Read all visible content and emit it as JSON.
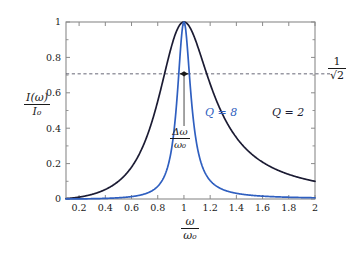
{
  "figure": {
    "background_color": "#ffffff",
    "frame_color": "#8a8a8a",
    "axis_label_color": "#1a1a1a"
  },
  "chart_data": {
    "type": "line",
    "title": "",
    "subtitle": "",
    "xlabel": "ω/ω₀",
    "ylabel": "I(ω)/I₀",
    "xlim": [
      0.1,
      2
    ],
    "ylim": [
      0,
      1
    ],
    "grid": false,
    "legend_position": "inline-on-curves",
    "x_ticks": [
      0.2,
      0.4,
      0.6,
      0.8,
      1,
      1.2,
      1.4,
      1.6,
      1.8,
      2
    ],
    "x_tick_labels": [
      "0.2",
      "0.4",
      "0.6",
      "0.8",
      "1",
      "1.2",
      "1.4",
      "1.6",
      "1.8",
      "2"
    ],
    "y_ticks": [
      0,
      0.2,
      0.4,
      0.6,
      0.8,
      1
    ],
    "y_tick_labels": [
      "0",
      "0.2",
      "0.4",
      "0.6",
      "0.8",
      "1"
    ],
    "y_minor_ticks": [
      0.1,
      0.3,
      0.5,
      0.7,
      0.9
    ],
    "series": [
      {
        "name": "Q = 2",
        "label": "Q = 2",
        "color": "#1b1b33",
        "Q": 2,
        "model": "lorentzian_resonance_intensity",
        "formula": "1 / (1 + Q^2 * (x - 1/x)^2)",
        "x": [
          0.1,
          0.2,
          0.3,
          0.4,
          0.5,
          0.6,
          0.7,
          0.8,
          0.9,
          0.95,
          1.0,
          1.05,
          1.1,
          1.2,
          1.3,
          1.4,
          1.5,
          1.6,
          1.7,
          1.8,
          1.9,
          2.0
        ],
        "values": [
          0.0063,
          0.0257,
          0.0609,
          0.1154,
          0.2,
          0.331,
          0.5168,
          0.7326,
          0.9264,
          0.9802,
          1.0,
          0.9823,
          0.9337,
          0.7974,
          0.6535,
          0.5297,
          0.4308,
          0.354,
          0.2945,
          0.248,
          0.2113,
          0.1818
        ],
        "half_max_crossings": [
          0.78,
          1.28
        ]
      },
      {
        "name": "Q = 8",
        "label": "Q = 8",
        "color": "#2f5fc0",
        "Q": 8,
        "model": "lorentzian_resonance_intensity",
        "formula": "1 / (1 + Q^2 * (x - 1/x)^2)",
        "x": [
          0.1,
          0.2,
          0.3,
          0.4,
          0.5,
          0.6,
          0.7,
          0.8,
          0.9,
          0.95,
          0.98,
          1.0,
          1.02,
          1.05,
          1.1,
          1.2,
          1.3,
          1.4,
          1.5,
          1.6,
          1.7,
          1.8,
          1.9,
          2.0
        ],
        "values": [
          0.0004,
          0.0016,
          0.0039,
          0.0075,
          0.0139,
          0.0254,
          0.0476,
          0.0927,
          0.1885,
          0.3325,
          0.5896,
          1.0,
          0.6062,
          0.3545,
          0.1615,
          0.0664,
          0.0353,
          0.0215,
          0.0143,
          0.0101,
          0.0075,
          0.0058,
          0.0046,
          0.0037
        ],
        "half_max_crossings": [
          0.9695,
          1.032
        ]
      }
    ],
    "reference_lines": [
      {
        "name": "half-power-line",
        "orientation": "horizontal",
        "value": 0.7071,
        "label": "1/√2",
        "style": "dashed",
        "color": "#555566"
      }
    ],
    "annotations": [
      {
        "name": "fwhm-annotation",
        "label": "Δω/ω₀",
        "numerator": "Δω",
        "denominator": "ω₀",
        "type": "double-headed-arrow-with-leader",
        "at_y": 0.7071,
        "x_start": 0.9695,
        "x_end": 1.032,
        "color": "#1a1a1a"
      }
    ]
  },
  "labels": {
    "y_axis": {
      "numerator": "I(ω)",
      "denominator": "I₀"
    },
    "x_axis": {
      "numerator": "ω",
      "denominator": "ω₀"
    },
    "half_power": {
      "numerator": "1",
      "denominator": "√2"
    },
    "fwhm": {
      "numerator": "Δω",
      "denominator": "ω₀"
    },
    "series_q2": "Q = 2",
    "series_q8": "Q = 8"
  },
  "tick_labels": {
    "x": [
      "0.2",
      "0.4",
      "0.6",
      "0.8",
      "1",
      "1.2",
      "1.4",
      "1.6",
      "1.8",
      "2"
    ],
    "y": [
      "0",
      "0.2",
      "0.4",
      "0.6",
      "0.8",
      "1"
    ]
  }
}
